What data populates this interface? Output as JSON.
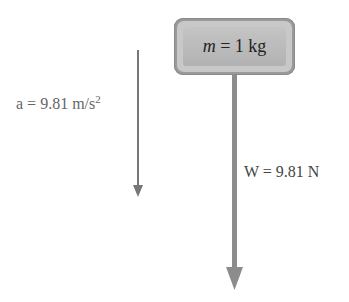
{
  "mass_box": {
    "variable": "m",
    "equals_value": " = 1 kg"
  },
  "acceleration": {
    "text": "a = 9.81 m/s",
    "exponent": "2"
  },
  "weight": {
    "text": "W = 9.81 N"
  },
  "colors": {
    "accel_arrow": "#777777",
    "weight_arrow": "#8c8c8c",
    "box_outer": "#9a9a9a",
    "box_inner": "#bcbcbc"
  }
}
